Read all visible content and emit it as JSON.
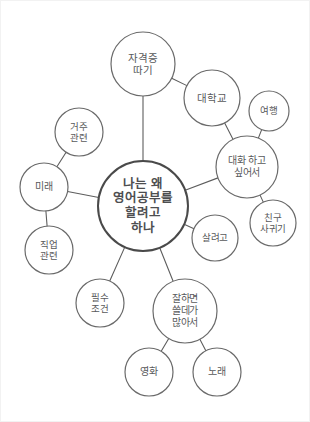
{
  "diagram": {
    "type": "mind-map",
    "title": "나는 왜 영어공부를 할려고 하나",
    "background_color": "#ffffff",
    "stroke_color": "#6a6a6a",
    "text_color": "#58595b",
    "root_stroke_color": "#4a4a4a",
    "width": 310,
    "height": 422
  },
  "nodes": [
    {
      "id": "root",
      "label": "나는 왜\n영어공부를\n할려고\n하나",
      "name": "node-root-why-study-english",
      "cx": 142,
      "cy": 205,
      "r": 45,
      "font_size": 12.5,
      "is_root": true
    },
    {
      "id": "certification",
      "label": "자격증\n따기",
      "name": "node-certification",
      "cx": 142,
      "cy": 63,
      "r": 32,
      "font_size": 10.5,
      "is_root": false
    },
    {
      "id": "university",
      "label": "대학교",
      "name": "node-university",
      "cx": 211,
      "cy": 97,
      "r": 28,
      "font_size": 10.5,
      "is_root": false
    },
    {
      "id": "travel",
      "label": "여행",
      "name": "node-travel",
      "cx": 268,
      "cy": 110,
      "r": 20,
      "font_size": 9.5,
      "is_root": false
    },
    {
      "id": "conversation",
      "label": "대화 하고\n싶어서",
      "name": "node-want-conversation",
      "cx": 246,
      "cy": 166,
      "r": 31,
      "font_size": 10,
      "is_root": false
    },
    {
      "id": "friends",
      "label": "친구\n사귀기",
      "name": "node-make-friends",
      "cx": 272,
      "cy": 222,
      "r": 23,
      "font_size": 9.5,
      "is_root": false
    },
    {
      "id": "survive",
      "label": "살려고",
      "name": "node-to-live",
      "cx": 214,
      "cy": 237,
      "r": 23,
      "font_size": 9.5,
      "is_root": false
    },
    {
      "id": "residence",
      "label": "거주\n관련",
      "name": "node-residence-related",
      "cx": 78,
      "cy": 131,
      "r": 24,
      "font_size": 9.5,
      "is_root": false
    },
    {
      "id": "future",
      "label": "미래",
      "name": "node-future",
      "cx": 43,
      "cy": 186,
      "r": 24,
      "font_size": 10,
      "is_root": false
    },
    {
      "id": "job",
      "label": "직업\n관련",
      "name": "node-job-related",
      "cx": 48,
      "cy": 249,
      "r": 24,
      "font_size": 9.5,
      "is_root": false
    },
    {
      "id": "requirement",
      "label": "필수\n조건",
      "name": "node-essential-requirement",
      "cx": 99,
      "cy": 302,
      "r": 24,
      "font_size": 9.5,
      "is_root": false
    },
    {
      "id": "useful",
      "label": "잘하면\n쓸데가\n많아서",
      "name": "node-many-uses-if-good",
      "cx": 184,
      "cy": 310,
      "r": 32,
      "font_size": 10,
      "is_root": false
    },
    {
      "id": "movies",
      "label": "영화",
      "name": "node-movies",
      "cx": 148,
      "cy": 371,
      "r": 24,
      "font_size": 10,
      "is_root": false
    },
    {
      "id": "songs",
      "label": "노래",
      "name": "node-songs",
      "cx": 216,
      "cy": 371,
      "r": 24,
      "font_size": 10,
      "is_root": false
    }
  ],
  "edges": [
    {
      "from": "root",
      "to": "certification",
      "name": "edge-root-certification"
    },
    {
      "from": "certification",
      "to": "university",
      "name": "edge-certification-university"
    },
    {
      "from": "university",
      "to": "conversation",
      "name": "edge-university-conversation"
    },
    {
      "from": "conversation",
      "to": "travel",
      "name": "edge-conversation-travel"
    },
    {
      "from": "conversation",
      "to": "friends",
      "name": "edge-conversation-friends"
    },
    {
      "from": "root",
      "to": "conversation",
      "name": "edge-root-conversation"
    },
    {
      "from": "root",
      "to": "survive",
      "name": "edge-root-survive"
    },
    {
      "from": "root",
      "to": "future",
      "name": "edge-root-future"
    },
    {
      "from": "future",
      "to": "residence",
      "name": "edge-future-residence"
    },
    {
      "from": "future",
      "to": "job",
      "name": "edge-future-job"
    },
    {
      "from": "root",
      "to": "requirement",
      "name": "edge-root-requirement"
    },
    {
      "from": "root",
      "to": "useful",
      "name": "edge-root-useful"
    },
    {
      "from": "useful",
      "to": "movies",
      "name": "edge-useful-movies"
    },
    {
      "from": "useful",
      "to": "songs",
      "name": "edge-useful-songs"
    }
  ]
}
